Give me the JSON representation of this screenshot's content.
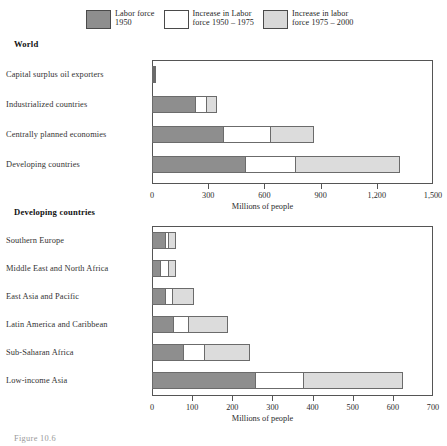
{
  "legend": {
    "items": [
      {
        "label": "Labor force\n1950",
        "swatch": "dark",
        "color": "#8e8e8e"
      },
      {
        "label": "Increase in Labor\nforce 1950 – 1975",
        "swatch": "white",
        "color": "#ffffff"
      },
      {
        "label": "Increase in labor\nforce 1975 – 2000",
        "swatch": "light",
        "color": "#d8d8d8"
      }
    ]
  },
  "sections": {
    "world_title": "World",
    "developing_title": "Developing countries"
  },
  "figure_caption": "Figure 10.6",
  "chart_data": [
    {
      "type": "bar",
      "orientation": "horizontal",
      "stacked": true,
      "title": "World",
      "xlabel": "Millions of people",
      "ylabel": "",
      "xlim": [
        0,
        1500
      ],
      "grid": false,
      "legend_position": "top",
      "ticks": [
        "0",
        "300",
        "600",
        "900",
        "1,200",
        "1,500"
      ],
      "tick_values": [
        0,
        300,
        600,
        900,
        1200,
        1500
      ],
      "categories": [
        "Capital surplus oil exporters",
        "Industrialized countries",
        "Centrally planned economies",
        "Developing countries"
      ],
      "series": [
        {
          "name": "Labor force 1950",
          "values": [
            5,
            235,
            385,
            500
          ]
        },
        {
          "name": "Increase in Labor force 1950 – 1975",
          "values": [
            3,
            65,
            255,
            275
          ]
        },
        {
          "name": "Increase in labor force 1975 – 2000",
          "values": [
            5,
            60,
            235,
            560
          ]
        }
      ]
    },
    {
      "type": "bar",
      "orientation": "horizontal",
      "stacked": true,
      "title": "Developing countries",
      "xlabel": "Millions of people",
      "ylabel": "",
      "xlim": [
        0,
        700
      ],
      "grid": false,
      "legend_position": "top",
      "ticks": [
        "0",
        "100",
        "200",
        "300",
        "400",
        "500",
        "600",
        "700"
      ],
      "tick_values": [
        0,
        100,
        200,
        300,
        400,
        500,
        600,
        700
      ],
      "categories": [
        "Southern Europe",
        "Middle East and North Africa",
        "East Asia and Pacific",
        "Latin America and Caribbean",
        "Sub-Saharan Africa",
        "Low-income Asia"
      ],
      "series": [
        {
          "name": "Labor force 1950",
          "values": [
            35,
            22,
            35,
            55,
            80,
            260
          ]
        },
        {
          "name": "Increase in Labor force 1950 – 1975",
          "values": [
            10,
            22,
            20,
            40,
            55,
            120
          ]
        },
        {
          "name": "Increase in labor force 1975 – 2000",
          "values": [
            20,
            22,
            55,
            100,
            115,
            250
          ]
        }
      ]
    }
  ]
}
